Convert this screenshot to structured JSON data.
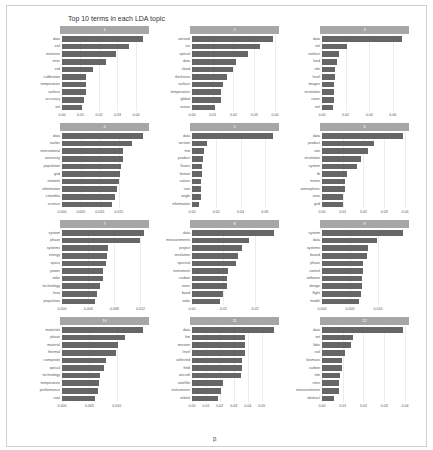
{
  "chart_data": {
    "type": "bar",
    "title": "Top 10 terms in each LDA topic",
    "xlabel": "β",
    "ylabel": "",
    "orientation": "horizontal",
    "grid": true,
    "facets": [
      {
        "topic": "1",
        "terms": [
          "data",
          "soil",
          "moisture",
          "error",
          "vsd",
          "calibration",
          "temperature",
          "surface",
          "accuracy",
          "set"
        ],
        "values": [
          0.044,
          0.036,
          0.029,
          0.024,
          0.017,
          0.013,
          0.013,
          0.013,
          0.012,
          0.011
        ],
        "xticks": [
          "0.00",
          "0.01",
          "0.02",
          "0.03",
          "0.04"
        ],
        "xmax": 0.046
      },
      {
        "topic": "2",
        "terms": [
          "aerosol",
          "ice",
          "optical",
          "data",
          "cloud",
          "thickness",
          "surface",
          "temperature",
          "global",
          "ocean"
        ],
        "values": [
          0.039,
          0.033,
          0.027,
          0.021,
          0.02,
          0.017,
          0.015,
          0.014,
          0.014,
          0.011
        ],
        "xticks": [
          "0.00",
          "0.01",
          "0.02",
          "0.03",
          "0.04"
        ],
        "xmax": 0.041
      },
      {
        "topic": "3",
        "terms": [
          "data",
          "set",
          "surface",
          "land",
          "site",
          "level",
          "images",
          "resolution",
          "cover",
          "net"
        ],
        "values": [
          0.068,
          0.021,
          0.014,
          0.013,
          0.011,
          0.011,
          0.01,
          0.01,
          0.01,
          0.009
        ],
        "xticks": [
          "0.00",
          "0.02",
          "0.04",
          "0.06"
        ],
        "xmax": 0.072
      },
      {
        "topic": "4",
        "terms": [
          "data",
          "earlier",
          "international",
          "university",
          "population",
          "grid",
          "network",
          "information",
          "columbia",
          "science"
        ],
        "values": [
          0.0215,
          0.0185,
          0.0162,
          0.0162,
          0.0155,
          0.0153,
          0.015,
          0.0146,
          0.014,
          0.0132
        ],
        "xticks": [
          "0.000",
          "0.005",
          "0.010",
          "0.015"
        ],
        "xmax": 0.0225
      },
      {
        "topic": "5",
        "terms": [
          "data",
          "version",
          "mw",
          "product",
          "fluxes",
          "format",
          "values",
          "rate",
          "angle",
          "information"
        ],
        "values": [
          0.067,
          0.012,
          0.01,
          0.009,
          0.008,
          0.008,
          0.007,
          0.007,
          0.007,
          0.006
        ],
        "xticks": [
          "0.00",
          "0.02",
          "0.04",
          "0.06"
        ],
        "xmax": 0.07
      },
      {
        "topic": "6",
        "terms": [
          "data",
          "product",
          "rain",
          "resolution",
          "system",
          "tb",
          "mems",
          "atmospheric",
          "area",
          "grid"
        ],
        "values": [
          0.039,
          0.025,
          0.022,
          0.019,
          0.017,
          0.012,
          0.011,
          0.011,
          0.01,
          0.01
        ],
        "xticks": [
          "0.00",
          "0.01",
          "0.02",
          "0.03",
          "0.04"
        ],
        "xmax": 0.041
      },
      {
        "topic": "7",
        "terms": [
          "system",
          "phase",
          "systems",
          "energy",
          "space",
          "power",
          "solar",
          "technology",
          "heat",
          "propulsion"
        ],
        "values": [
          0.0125,
          0.0119,
          0.0071,
          0.0069,
          0.0068,
          0.0062,
          0.0062,
          0.0058,
          0.0053,
          0.0051
        ],
        "xticks": [
          "0.000",
          "0.004",
          "0.008",
          "0.012"
        ],
        "xmax": 0.013
      },
      {
        "topic": "8",
        "terms": [
          "data",
          "measurements",
          "project",
          "resolution",
          "spectral",
          "instrument",
          "carbon",
          "rover",
          "band",
          "solar"
        ],
        "values": [
          0.026,
          0.018,
          0.016,
          0.0145,
          0.014,
          0.0115,
          0.011,
          0.011,
          0.0098,
          0.0088
        ],
        "xticks": [
          "0.00",
          "0.01",
          "0.02"
        ],
        "xmax": 0.027
      },
      {
        "topic": "9",
        "terms": [
          "system",
          "data",
          "systems",
          "based",
          "phase",
          "control",
          "software",
          "design",
          "flight",
          "model"
        ],
        "values": [
          0.0145,
          0.0098,
          0.0082,
          0.008,
          0.0074,
          0.0074,
          0.0072,
          0.0071,
          0.007,
          0.0066
        ],
        "xticks": [
          "0.000",
          "0.005",
          "0.010"
        ],
        "xmax": 0.0152
      },
      {
        "topic": "10",
        "terms": [
          "materials",
          "phase",
          "material",
          "thermal",
          "composite",
          "optical",
          "technology",
          "temperature",
          "performance",
          "coat"
        ],
        "values": [
          0.0148,
          0.0115,
          0.0103,
          0.0099,
          0.0081,
          0.0077,
          0.0069,
          0.0067,
          0.0066,
          0.006
        ],
        "xticks": [
          "0.000",
          "0.005",
          "0.010"
        ],
        "xmax": 0.0155
      },
      {
        "topic": "11",
        "terms": [
          "data",
          "km",
          "mission",
          "level",
          "collected",
          "field",
          "aircraft",
          "satellite",
          "instruments",
          "orbital"
        ],
        "values": [
          0.059,
          0.038,
          0.038,
          0.038,
          0.036,
          0.036,
          0.035,
          0.022,
          0.021,
          0.019
        ],
        "xticks": [
          "0.00",
          "0.01",
          "0.02",
          "0.03",
          "0.04",
          "0.05"
        ],
        "xmax": 0.061
      },
      {
        "topic": "12",
        "terms": [
          "data",
          "set",
          "lidar",
          "soil",
          "biomass",
          "carbon",
          "site",
          "sites",
          "measurements",
          "abstract"
        ],
        "values": [
          0.039,
          0.015,
          0.014,
          0.011,
          0.0095,
          0.0095,
          0.0085,
          0.0082,
          0.008,
          0.006
        ],
        "xticks": [
          "0.00",
          "0.01",
          "0.02",
          "0.03",
          "0.04"
        ],
        "xmax": 0.041
      }
    ]
  },
  "colors": {
    "bar": "#666666",
    "strip": "#a6a6a6",
    "grid": "#ececec"
  }
}
